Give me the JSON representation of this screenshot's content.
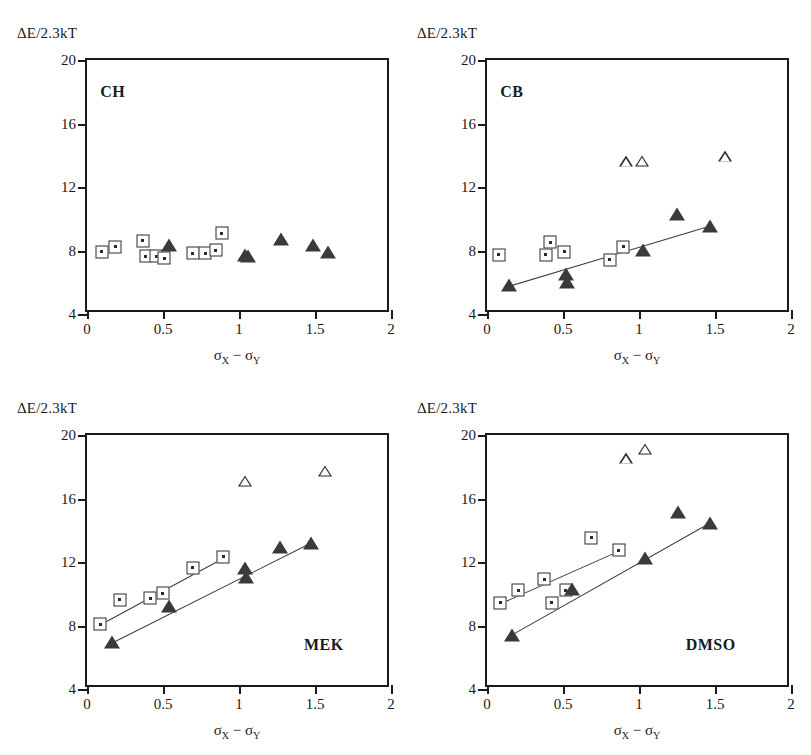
{
  "figure": {
    "axis_y_label": "ΔE/2.3kT",
    "axis_x_label_main": "σ",
    "axis_x_sub1": "X",
    "axis_x_dash": "−",
    "axis_x_sub2": "Y",
    "y_ticks": [
      "20",
      "16",
      "12",
      "8",
      "4"
    ],
    "x_ticks": [
      "0",
      "0.5",
      "1",
      "1.5",
      "2"
    ],
    "marker_legend": {
      "open_square": "open-square-with-dot",
      "filled_triangle": "filled-triangle",
      "open_triangle": "open-triangle"
    }
  },
  "chart_data": [
    {
      "type": "scatter",
      "panel": "CH",
      "title": "CH",
      "xlabel": "σX − σY",
      "ylabel": "ΔE/2.3kT",
      "xlim": [
        0,
        2
      ],
      "ylim": [
        4,
        20
      ],
      "xticks": [
        0,
        0.5,
        1,
        1.5,
        2
      ],
      "yticks": [
        4,
        8,
        12,
        16,
        20
      ],
      "grid": false,
      "legend": "none",
      "series": [
        {
          "name": "open squares",
          "marker": "open-square",
          "points": [
            [
              0.11,
              7.8
            ],
            [
              0.2,
              8.1
            ],
            [
              0.38,
              8.5
            ],
            [
              0.4,
              7.5
            ],
            [
              0.47,
              7.5
            ],
            [
              0.52,
              7.4
            ],
            [
              0.71,
              7.7
            ],
            [
              0.79,
              7.7
            ],
            [
              0.86,
              7.9
            ],
            [
              0.9,
              8.95
            ]
          ]
        },
        {
          "name": "filled triangles",
          "marker": "filled-triangle",
          "points": [
            [
              0.55,
              8.2
            ],
            [
              1.05,
              7.6
            ],
            [
              1.07,
              7.5
            ],
            [
              1.29,
              8.6
            ],
            [
              1.5,
              8.2
            ],
            [
              1.6,
              7.8
            ]
          ]
        }
      ],
      "fit_lines": []
    },
    {
      "type": "scatter",
      "panel": "CB",
      "title": "CB",
      "xlabel": "σX − σY",
      "ylabel": "ΔE/2.3kT",
      "xlim": [
        0,
        2
      ],
      "ylim": [
        4,
        20
      ],
      "xticks": [
        0,
        0.5,
        1,
        1.5,
        2
      ],
      "yticks": [
        4,
        8,
        12,
        16,
        20
      ],
      "grid": false,
      "legend": "none",
      "series": [
        {
          "name": "open squares",
          "marker": "open-square",
          "points": [
            [
              0.09,
              7.6
            ],
            [
              0.4,
              7.6
            ],
            [
              0.43,
              8.4
            ],
            [
              0.52,
              7.8
            ],
            [
              0.82,
              7.3
            ],
            [
              0.91,
              8.1
            ]
          ]
        },
        {
          "name": "filled triangles",
          "marker": "filled-triangle",
          "points": [
            [
              0.16,
              5.7
            ],
            [
              0.53,
              6.4
            ],
            [
              0.54,
              5.9
            ],
            [
              1.04,
              7.9
            ],
            [
              1.26,
              10.2
            ],
            [
              1.48,
              9.4
            ]
          ]
        },
        {
          "name": "open triangles",
          "marker": "open-triangle",
          "points": [
            [
              0.93,
              13.5
            ],
            [
              1.03,
              14.2
            ],
            [
              1.58,
              15.2
            ]
          ]
        }
      ],
      "fit_lines": [
        {
          "name": "triangle-fit",
          "x0": 0.13,
          "y0": 5.6,
          "x1": 1.49,
          "y1": 9.5
        }
      ]
    },
    {
      "type": "scatter",
      "panel": "MEK",
      "title": "MEK",
      "xlabel": "σX − σY",
      "ylabel": "ΔE/2.3kT",
      "xlim": [
        0,
        2
      ],
      "ylim": [
        4,
        20
      ],
      "xticks": [
        0,
        0.5,
        1,
        1.5,
        2
      ],
      "yticks": [
        4,
        8,
        12,
        16,
        20
      ],
      "grid": false,
      "legend": "none",
      "series": [
        {
          "name": "open squares",
          "marker": "open-square",
          "points": [
            [
              0.1,
              7.95
            ],
            [
              0.23,
              9.5
            ],
            [
              0.43,
              9.6
            ],
            [
              0.51,
              9.9
            ],
            [
              0.71,
              11.5
            ],
            [
              0.91,
              12.2
            ]
          ]
        },
        {
          "name": "filled triangles",
          "marker": "filled-triangle",
          "points": [
            [
              0.18,
              6.85
            ],
            [
              0.55,
              9.1
            ],
            [
              1.05,
              11.5
            ],
            [
              1.06,
              10.9
            ],
            [
              1.28,
              12.8
            ],
            [
              1.49,
              13.1
            ]
          ]
        },
        {
          "name": "open triangles",
          "marker": "open-triangle",
          "points": [
            [
              1.05,
              17.0
            ],
            [
              1.58,
              18.3
            ]
          ]
        }
      ],
      "fit_lines": [
        {
          "name": "square-fit",
          "x0": 0.09,
          "y0": 7.9,
          "x1": 0.93,
          "y1": 12.25
        },
        {
          "name": "triangle-fit",
          "x0": 0.17,
          "y0": 6.8,
          "x1": 1.5,
          "y1": 13.2
        }
      ]
    },
    {
      "type": "scatter",
      "panel": "DMSO",
      "title": "DMSO",
      "xlabel": "σX − σY",
      "ylabel": "ΔE/2.3kT",
      "xlim": [
        0,
        2
      ],
      "ylim": [
        4,
        20
      ],
      "xticks": [
        0,
        0.5,
        1,
        1.5,
        2
      ],
      "yticks": [
        4,
        8,
        12,
        16,
        20
      ],
      "grid": false,
      "legend": "none",
      "series": [
        {
          "name": "open squares",
          "marker": "open-square",
          "points": [
            [
              0.1,
              9.3
            ],
            [
              0.22,
              10.1
            ],
            [
              0.39,
              10.8
            ],
            [
              0.44,
              9.3
            ],
            [
              0.53,
              10.1
            ],
            [
              0.7,
              13.4
            ],
            [
              0.88,
              12.6
            ]
          ]
        },
        {
          "name": "filled triangles",
          "marker": "filled-triangle",
          "points": [
            [
              0.18,
              7.3
            ],
            [
              0.57,
              10.2
            ],
            [
              1.05,
              12.1
            ],
            [
              1.27,
              15.0
            ],
            [
              1.48,
              14.3
            ]
          ]
        },
        {
          "name": "open triangles",
          "marker": "open-triangle",
          "points": [
            [
              0.93,
              18.4
            ],
            [
              1.05,
              19.7
            ]
          ]
        }
      ],
      "fit_lines": [
        {
          "name": "square-fit",
          "x0": 0.09,
          "y0": 9.25,
          "x1": 0.9,
          "y1": 12.7
        },
        {
          "name": "triangle-fit",
          "x0": 0.17,
          "y0": 7.25,
          "x1": 1.49,
          "y1": 14.4
        }
      ]
    }
  ]
}
